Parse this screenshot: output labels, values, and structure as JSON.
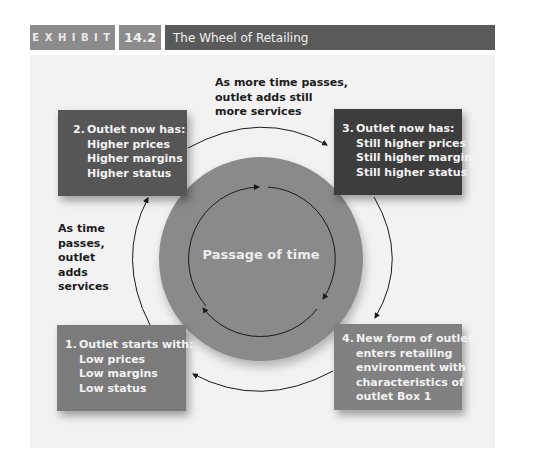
{
  "header": {
    "exhibit_label": "EXHIBIT",
    "exhibit_number": "14.2",
    "title": "The Wheel of Retailing"
  },
  "diagram": {
    "center_label": "Passage of time",
    "boxes": [
      {
        "number": "1.",
        "heading": "Outlet starts with:",
        "lines": [
          "Low prices",
          "Low margins",
          "Low status"
        ]
      },
      {
        "number": "2.",
        "heading": "Outlet now has:",
        "lines": [
          "Higher prices",
          "Higher margins",
          "Higher status"
        ]
      },
      {
        "number": "3.",
        "heading": "Outlet now has:",
        "lines": [
          "Still higher prices",
          "Still higher margins",
          "Still higher status"
        ]
      },
      {
        "number": "4.",
        "heading": "New form of outlet",
        "lines": [
          "enters retailing",
          "environment with",
          "characteristics of",
          "outlet Box 1"
        ]
      }
    ],
    "annotations": {
      "top": [
        "As more time passes,",
        "outlet adds still",
        "more services"
      ],
      "left": [
        "As time",
        "passes,",
        "outlet",
        "adds",
        "services"
      ]
    },
    "colors": {
      "box1": "#7b7b7b",
      "box2": "#565656",
      "box3": "#3d3d3d",
      "box4": "#818181",
      "circle": "#8a8a8a",
      "panel": "#f2f2f2",
      "header_dark": "#5a5a5a",
      "header_light": "#8c8c8c"
    }
  }
}
